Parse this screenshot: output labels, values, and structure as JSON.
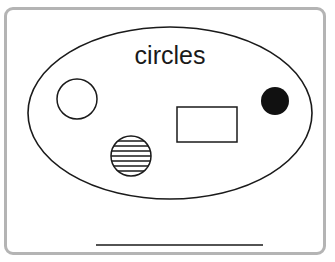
{
  "diagram": {
    "set_label": "circles",
    "colors": {
      "stroke": "#1a1a1a",
      "border": "#b4b4b4",
      "fill_solid": "#111111",
      "background": "#ffffff"
    },
    "shapes": [
      {
        "type": "circle",
        "style": "outline",
        "cx": 77,
        "cy": 99,
        "r": 20
      },
      {
        "type": "rectangle",
        "style": "outline",
        "x": 177,
        "y": 107,
        "width": 60,
        "height": 35
      },
      {
        "type": "circle",
        "style": "solid-black",
        "cx": 275,
        "cy": 101,
        "r": 14
      },
      {
        "type": "circle",
        "style": "horizontal-stripes",
        "cx": 131,
        "cy": 156,
        "r": 20
      }
    ],
    "answer_line": {
      "x1": 96,
      "x2": 263,
      "y": 245
    }
  }
}
